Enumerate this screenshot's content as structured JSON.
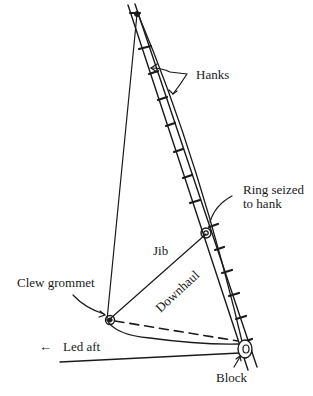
{
  "diagram": {
    "labels": {
      "hanks": "Hanks",
      "ring_line1": "Ring seized",
      "ring_line2": "to hank",
      "jib": "Jib",
      "clew_grommet": "Clew grommet",
      "downhaul": "Downhaul",
      "led_aft": "Led aft",
      "led_aft_arrow": "←",
      "block": "Block"
    },
    "colors": {
      "ink": "#1a1a1a",
      "background": "#ffffff"
    }
  }
}
